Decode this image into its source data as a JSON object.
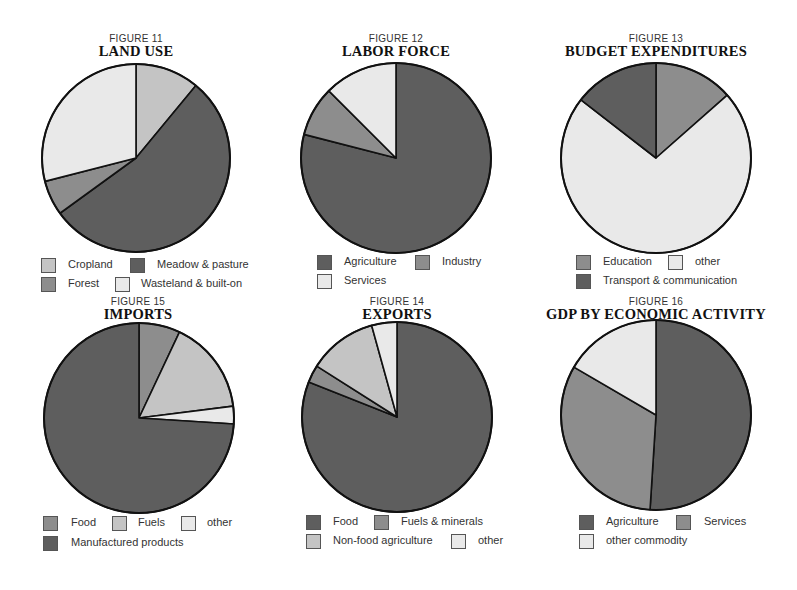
{
  "colors": {
    "dark": "#5e5e5e",
    "medium": "#8d8d8d",
    "light": "#c4c4c4",
    "lightest": "#e9e9e9",
    "outline": "#111111"
  },
  "chart_data": [
    {
      "id": "fig11",
      "type": "pie",
      "figure_label": "FIGURE 11",
      "title": "LAND USE",
      "categories": [
        "Cropland",
        "Meadow & pasture",
        "Forest",
        "Wasteland & built-on"
      ],
      "values": [
        11,
        54,
        6,
        29
      ],
      "colors": [
        "light",
        "dark",
        "medium",
        "lightest"
      ],
      "start_angle_deg": 0,
      "direction": "clockwise",
      "legend": [
        {
          "label": "Cropland",
          "color": "light"
        },
        {
          "label": "Meadow & pasture",
          "color": "dark"
        },
        {
          "label": "Forest",
          "color": "medium"
        },
        {
          "label": "Wasteland & built-on",
          "color": "lightest"
        }
      ]
    },
    {
      "id": "fig12",
      "type": "pie",
      "figure_label": "FIGURE 12",
      "title": "LABOR FORCE",
      "categories": [
        "Agriculture",
        "Industry",
        "Services"
      ],
      "values": [
        79,
        8.5,
        12.5
      ],
      "colors": [
        "dark",
        "medium",
        "lightest"
      ],
      "start_angle_deg": 0,
      "direction": "clockwise",
      "legend": [
        {
          "label": "Agriculture",
          "color": "dark"
        },
        {
          "label": "Industry",
          "color": "medium"
        },
        {
          "label": "Services",
          "color": "lightest"
        }
      ]
    },
    {
      "id": "fig13",
      "type": "pie",
      "figure_label": "FIGURE 13",
      "title": "BUDGET EXPENDITURES",
      "categories": [
        "Education",
        "other",
        "Transport & communication"
      ],
      "values": [
        13.5,
        72,
        14.5
      ],
      "colors": [
        "medium",
        "lightest",
        "dark"
      ],
      "start_angle_deg": 0,
      "direction": "clockwise",
      "legend": [
        {
          "label": "Education",
          "color": "medium"
        },
        {
          "label": "other",
          "color": "lightest"
        },
        {
          "label": "Transport & communication",
          "color": "dark"
        }
      ]
    },
    {
      "id": "fig15",
      "type": "pie",
      "figure_label": "FIGURE 15",
      "title": "IMPORTS",
      "categories": [
        "Food",
        "Fuels",
        "other",
        "Manufactured products"
      ],
      "values": [
        7,
        16,
        3,
        74
      ],
      "colors": [
        "medium",
        "light",
        "lightest",
        "dark"
      ],
      "start_angle_deg": 0,
      "direction": "clockwise",
      "legend": [
        {
          "label": "Food",
          "color": "medium"
        },
        {
          "label": "Fuels",
          "color": "light"
        },
        {
          "label": "other",
          "color": "lightest"
        },
        {
          "label": "Manufactured products",
          "color": "dark"
        }
      ]
    },
    {
      "id": "fig14",
      "type": "pie",
      "figure_label": "FIGURE 14",
      "title": "EXPORTS",
      "categories": [
        "Food",
        "Fuels & minerals",
        "Non-food agriculture",
        "other"
      ],
      "values": [
        81,
        3,
        11.7,
        4.3
      ],
      "colors": [
        "dark",
        "medium",
        "light",
        "lightest"
      ],
      "start_angle_deg": 0,
      "direction": "clockwise",
      "legend": [
        {
          "label": "Food",
          "color": "dark"
        },
        {
          "label": "Fuels & minerals",
          "color": "medium"
        },
        {
          "label": "Non-food agriculture",
          "color": "light"
        },
        {
          "label": "other",
          "color": "lightest"
        }
      ]
    },
    {
      "id": "fig16",
      "type": "pie",
      "figure_label": "FIGURE 16",
      "title": "GDP BY ECONOMIC ACTIVITY",
      "categories": [
        "Agriculture",
        "Services",
        "other commodity"
      ],
      "values": [
        51,
        32.4,
        16.6
      ],
      "colors": [
        "dark",
        "medium",
        "lightest"
      ],
      "start_angle_deg": 0,
      "direction": "clockwise",
      "legend": [
        {
          "label": "Agriculture",
          "color": "dark"
        },
        {
          "label": "Services",
          "color": "medium"
        },
        {
          "label": "other commodity",
          "color": "lightest"
        }
      ]
    }
  ]
}
